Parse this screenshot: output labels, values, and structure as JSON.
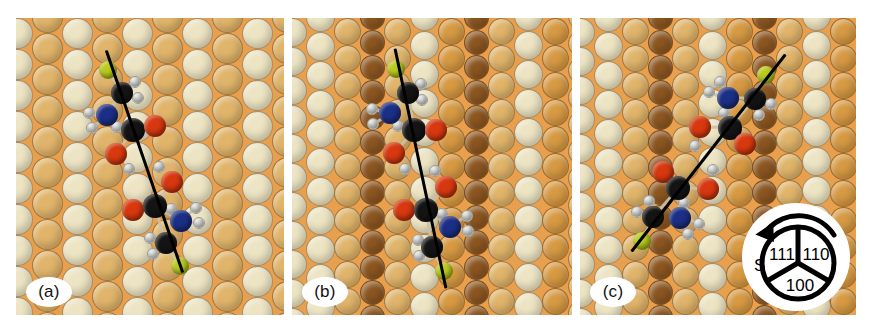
{
  "figure": {
    "type": "molecular-adsorption-schematic",
    "panel_count": 3
  },
  "panels": [
    {
      "id": "a",
      "label": "(a)",
      "surface_style": "flat-terrace",
      "axis_tilt_deg": 19,
      "axis_label": "molecular axis"
    },
    {
      "id": "b",
      "label": "(b)",
      "surface_style": "stepped-terrace",
      "axis_tilt_deg": 12,
      "axis_label": "molecular axis"
    },
    {
      "id": "c",
      "label": "(c)",
      "surface_style": "stepped-terrace",
      "axis_tilt_deg": -38,
      "axis_label": "molecular axis"
    }
  ],
  "compass": {
    "name": "stereographic-triangle",
    "pole_label": "S",
    "sectors": [
      {
        "index": "111",
        "position": "upper-left"
      },
      {
        "index": "110",
        "position": "upper-right"
      },
      {
        "index": "100",
        "position": "bottom"
      }
    ],
    "arrow": "rotation-arrow"
  },
  "legend": {
    "atoms": [
      {
        "element": "C",
        "name": "carbon",
        "color": "#141414"
      },
      {
        "element": "O",
        "name": "oxygen",
        "color": "#d8380f"
      },
      {
        "element": "N",
        "name": "nitrogen",
        "color": "#1b2f86"
      },
      {
        "element": "H",
        "name": "hydrogen",
        "color": "#f7f7f4"
      },
      {
        "element": "S",
        "name": "sulfur",
        "color": "#b9cc1b"
      }
    ]
  },
  "colors": {
    "background": "#ffffff",
    "substrate_orange": "#e8a04f",
    "sphere_cream": "#ece4c2",
    "sphere_tan": "#e0b46a",
    "sphere_amber": "#d79a43",
    "sphere_dark": "#8c5620",
    "axis_line": "#000000"
  }
}
